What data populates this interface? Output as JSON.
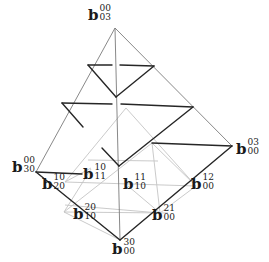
{
  "diagram": {
    "title": "",
    "colors": {
      "bold": "#222222",
      "mid": "#6a6a6a",
      "light": "#bdbdbd"
    },
    "labels": [
      {
        "id": "b03_00",
        "base": "b",
        "sup": "00",
        "sub": "03",
        "x": 78,
        "y": 12
      },
      {
        "id": "b30_00",
        "base": "b",
        "sup": "00",
        "sub": "30",
        "x": 12,
        "y": 163
      },
      {
        "id": "b11_10",
        "base": "b",
        "sup": "10",
        "sub": "11",
        "x": 81,
        "y": 167
      },
      {
        "id": "b00_03",
        "base": "b",
        "sup": "03",
        "sub": "00",
        "x": 236,
        "y": 139
      },
      {
        "id": "b20_10",
        "base": "b",
        "sup": "10",
        "sub": "20",
        "x": 40,
        "y": 179
      },
      {
        "id": "b10_11",
        "base": "b",
        "sup": "11",
        "sub": "10",
        "x": 121,
        "y": 178
      },
      {
        "id": "b00_12",
        "base": "b",
        "sup": "12",
        "sub": "00",
        "x": 190,
        "y": 178
      },
      {
        "id": "b10_20",
        "base": "b",
        "sup": "20",
        "sub": "10",
        "x": 73,
        "y": 207
      },
      {
        "id": "b00_21",
        "base": "b",
        "sup": "21",
        "sub": "00",
        "x": 152,
        "y": 208
      },
      {
        "id": "b00_30",
        "base": "b",
        "sup": "30",
        "sub": "00",
        "x": 110,
        "y": 243
      }
    ]
  }
}
